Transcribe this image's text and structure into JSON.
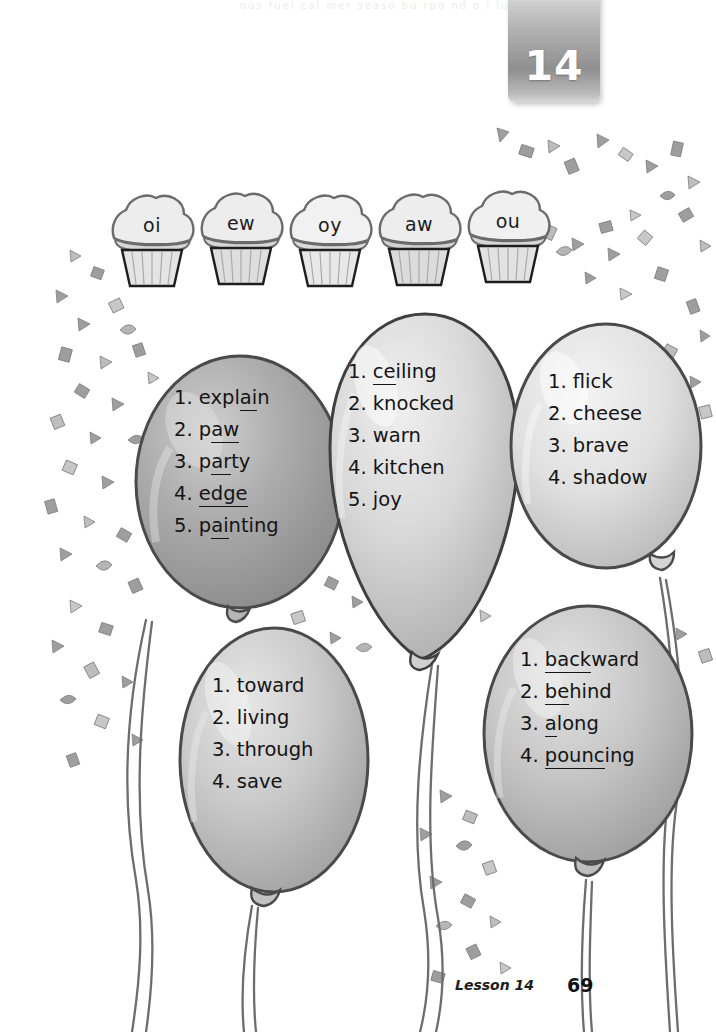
{
  "page": {
    "width": 716,
    "height": 1032,
    "background": "#ffffff",
    "ghost_text": "ous fuel cal mer   seaso   bu   rpo   nd  o  i  lu"
  },
  "lesson_tab": {
    "number": "14",
    "color": "#9a9a9a",
    "text_color": "#ffffff"
  },
  "cupcakes": {
    "name": "phonics-cupcake-row",
    "items": [
      {
        "label": "oi"
      },
      {
        "label": "ew"
      },
      {
        "label": "oy"
      },
      {
        "label": "aw"
      },
      {
        "label": "ou"
      }
    ]
  },
  "balloons": [
    {
      "id": "balloon-left-upper",
      "fill": "#a9a9a9",
      "words": [
        {
          "number": "1.",
          "pre": "expl",
          "underlined": "ai",
          "post": "n"
        },
        {
          "number": "2.",
          "pre": "p",
          "underlined": "aw",
          "post": ""
        },
        {
          "number": "3.",
          "pre": "p",
          "underlined": "ar",
          "post": "ty"
        },
        {
          "number": "4.",
          "pre": "",
          "underlined": "edge",
          "post": ""
        },
        {
          "number": "5.",
          "pre": "p",
          "underlined": "ai",
          "post": "nting"
        }
      ]
    },
    {
      "id": "balloon-middle",
      "fill": "#d4d4d4",
      "words": [
        {
          "number": "1.",
          "pre": "",
          "underlined": "ce",
          "post": "iling"
        },
        {
          "number": "2.",
          "pre": "knocked",
          "underlined": "",
          "post": ""
        },
        {
          "number": "3.",
          "pre": "warn",
          "underlined": "",
          "post": ""
        },
        {
          "number": "4.",
          "pre": "kitchen",
          "underlined": "",
          "post": ""
        },
        {
          "number": "5.",
          "pre": "joy",
          "underlined": "",
          "post": ""
        }
      ]
    },
    {
      "id": "balloon-right-upper",
      "fill": "#dcdcdc",
      "words": [
        {
          "number": "1.",
          "pre": "flick",
          "underlined": "",
          "post": ""
        },
        {
          "number": "2.",
          "pre": "cheese",
          "underlined": "",
          "post": ""
        },
        {
          "number": "3.",
          "pre": "brave",
          "underlined": "",
          "post": ""
        },
        {
          "number": "4.",
          "pre": "shadow",
          "underlined": "",
          "post": ""
        }
      ]
    },
    {
      "id": "balloon-left-lower",
      "fill": "#c6c6c6",
      "words": [
        {
          "number": "1.",
          "pre": "toward",
          "underlined": "",
          "post": ""
        },
        {
          "number": "2.",
          "pre": "living",
          "underlined": "",
          "post": ""
        },
        {
          "number": "3.",
          "pre": "through",
          "underlined": "",
          "post": ""
        },
        {
          "number": "4.",
          "pre": "save",
          "underlined": "",
          "post": ""
        }
      ]
    },
    {
      "id": "balloon-right-lower",
      "fill": "#c2c2c2",
      "words": [
        {
          "number": "1.",
          "pre": "",
          "underlined": "back",
          "post": "ward"
        },
        {
          "number": "2.",
          "pre": "",
          "underlined": "be",
          "post": "hind"
        },
        {
          "number": "3.",
          "pre": "",
          "underlined": "a",
          "post": "long"
        },
        {
          "number": "4.",
          "pre": "",
          "underlined": "pounc",
          "post": "ing"
        }
      ]
    }
  ],
  "footer": {
    "lesson_label": "Lesson 14",
    "page_number": "69"
  }
}
